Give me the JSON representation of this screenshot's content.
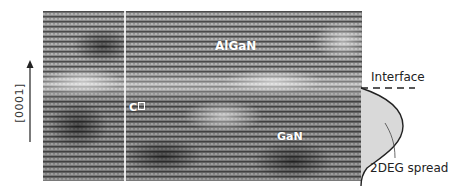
{
  "figure": {
    "axis": {
      "direction_label": "[0001]",
      "arrow": "up-arrow"
    },
    "micrograph": {
      "type": "HRTEM lattice image",
      "layers": [
        {
          "name": "AlGaN",
          "position": "top"
        },
        {
          "name": "GaN",
          "position": "bottom"
        }
      ],
      "labels": {
        "top_layer": "AlGaN",
        "bottom_layer": "GaN",
        "marker": "C",
        "marker_suffix_glyph": "box"
      },
      "marker_line": "vertical white line"
    },
    "annotations": {
      "interface": "Interface",
      "spread": "2DEG spread"
    },
    "colors": {
      "background": "#ffffff",
      "micrograph_mid_gray": "#7a7a7a",
      "label_text": "#ffffff",
      "profile_fill": "#d9d9d9",
      "profile_stroke": "#222222",
      "annotation_text": "#222222"
    }
  }
}
